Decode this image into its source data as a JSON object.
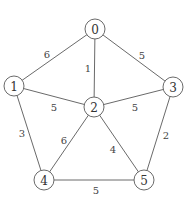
{
  "graph": {
    "nodes": [
      {
        "id": "0",
        "x": 95,
        "y": 29
      },
      {
        "id": "1",
        "x": 14,
        "y": 86
      },
      {
        "id": "2",
        "x": 94,
        "y": 107
      },
      {
        "id": "3",
        "x": 173,
        "y": 87
      },
      {
        "id": "4",
        "x": 44,
        "y": 180
      },
      {
        "id": "5",
        "x": 144,
        "y": 180
      }
    ],
    "edges": [
      {
        "from": "0",
        "to": "1",
        "weight": "6",
        "lx": 47,
        "ly": 54
      },
      {
        "from": "0",
        "to": "2",
        "weight": "1",
        "lx": 88,
        "ly": 68
      },
      {
        "from": "0",
        "to": "3",
        "weight": "5",
        "lx": 142,
        "ly": 55
      },
      {
        "from": "1",
        "to": "2",
        "weight": "5",
        "lx": 54,
        "ly": 107
      },
      {
        "from": "2",
        "to": "3",
        "weight": "5",
        "lx": 135,
        "ly": 107
      },
      {
        "from": "1",
        "to": "4",
        "weight": "3",
        "lx": 22,
        "ly": 133
      },
      {
        "from": "2",
        "to": "4",
        "weight": "6",
        "lx": 64,
        "ly": 140
      },
      {
        "from": "2",
        "to": "5",
        "weight": "4",
        "lx": 113,
        "ly": 149
      },
      {
        "from": "3",
        "to": "5",
        "weight": "2",
        "lx": 166,
        "ly": 135
      },
      {
        "from": "4",
        "to": "5",
        "weight": "5",
        "lx": 96,
        "ly": 190
      }
    ],
    "node_radius": 10,
    "stroke_color": "#6a6a6a"
  }
}
